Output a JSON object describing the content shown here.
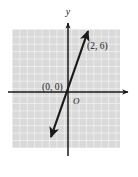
{
  "figure": {
    "kind": "coordinate-plane-graph",
    "background_color": "#ffffff",
    "grid": {
      "fill_color": "#d9d9d9",
      "line_color": "#f4f4f4",
      "cell_size_px": 7.4,
      "left_px": 12,
      "top_px": 29,
      "width_px": 108,
      "height_px": 119,
      "columns": 15,
      "rows": 16,
      "visible": true
    },
    "axes": {
      "color": "#1a1a1a",
      "origin_px": {
        "x": 68,
        "y": 92
      },
      "x_axis": {
        "label": "",
        "start_px": {
          "x": 8,
          "y": 92
        },
        "end_px": {
          "x": 131,
          "y": 92
        },
        "arrow_right": true,
        "arrow_left": false
      },
      "y_axis": {
        "label": "y",
        "label_px": {
          "x": 68,
          "y": 12
        },
        "start_px": {
          "x": 68,
          "y": 156
        },
        "end_px": {
          "x": 68,
          "y": 20
        },
        "arrow_up": true,
        "arrow_down": false
      },
      "origin_label": "O",
      "origin_label_px": {
        "x": 73,
        "y": 104
      }
    },
    "line": {
      "color": "#1a1a1a",
      "stroke_width_px": 2.2,
      "slope": 3,
      "intercept": 0,
      "equation": "y = 3x",
      "arrow_start": true,
      "arrow_end": true,
      "start_px": {
        "x": 50,
        "y": 138
      },
      "end_px": {
        "x": 89,
        "y": 29
      }
    },
    "labels": [
      {
        "name": "origin-point-label",
        "text": "(0, 0)",
        "x_px": 42,
        "y_px": 90,
        "font_size_px": 9.5
      },
      {
        "name": "second-point-label",
        "text": "(2, 6)",
        "x_px": 87,
        "y_px": 49,
        "font_size_px": 9.5
      }
    ],
    "axis_letter_font_size_px": 10,
    "origin_letter_font_size_px": 9
  },
  "chart_data": {
    "type": "line",
    "title": "",
    "xlabel": "",
    "ylabel": "y",
    "equation": "y = 3x",
    "slope": 3,
    "y_intercept": 0,
    "points": [
      {
        "label": "(0, 0)",
        "x": 0,
        "y": 0
      },
      {
        "label": "(2, 6)",
        "x": 2,
        "y": 6
      }
    ],
    "x": [
      0,
      2
    ],
    "values": [
      0,
      6
    ],
    "xlim": [
      -7.5,
      7
    ],
    "ylim": [
      -8.5,
      8.5
    ],
    "grid": true,
    "legend": "none",
    "arrows_both_ends": true
  }
}
